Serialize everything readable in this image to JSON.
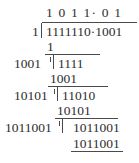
{
  "figure": {
    "kind": "binary-long-division",
    "ink_color": "#2e2e2e",
    "rule_color": "#4a4a4a",
    "background": "#ffffff"
  },
  "quotient": {
    "text": "1 0 1 1· 0 1"
  },
  "division_main": {
    "divisor": "1",
    "dividend": "1111110·1001"
  },
  "steps": [
    {
      "product": "1",
      "divisor": "1001",
      "remainder": "1111"
    },
    {
      "product": "1001",
      "divisor": "10101",
      "remainder": "11010"
    },
    {
      "product": "10101",
      "divisor": "1011001",
      "remainder": "1011001"
    }
  ],
  "final_product": "1011001"
}
